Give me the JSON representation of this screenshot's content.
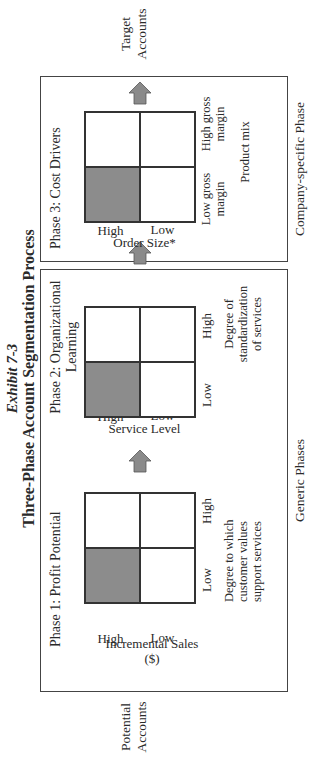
{
  "exhibit": {
    "label": "Exhibit 7-3",
    "title": "Three-Phase Account Segmentation Process"
  },
  "flow": {
    "start": {
      "line1": "Potential",
      "line2": "Accounts"
    },
    "end": {
      "line1": "Target",
      "line2": "Accounts"
    }
  },
  "sections": {
    "generic": {
      "label": "Generic Phases"
    },
    "company_specific": {
      "label": "Company-specific Phase"
    }
  },
  "phases": [
    {
      "title_line1": "Phase 1: Profit Potential",
      "title_line2": "",
      "y_axis_label": "Incremental Sales ($)",
      "y_high": "High",
      "y_low": "Low",
      "x_low": "Low",
      "x_high": "High",
      "x_axis_label_line1": "Degree to which",
      "x_axis_label_line2": "customer values",
      "x_axis_label_line3": "support services",
      "shaded_quadrant": "high-y / low-x"
    },
    {
      "title_line1": "Phase 2: Organizational",
      "title_line2": "Learning",
      "y_axis_label": "Service Level",
      "y_high": "High",
      "y_low": "Low",
      "x_low": "Low",
      "x_high": "High",
      "x_axis_label_line1": "Degree of",
      "x_axis_label_line2": "standardization",
      "x_axis_label_line3": "of services",
      "shaded_quadrant": "high-y / low-x"
    },
    {
      "title_line1": "Phase 3: Cost Drivers",
      "title_line2": "",
      "y_axis_label": "Order Size*",
      "y_high": "High",
      "y_low": "Low",
      "x_low_line1": "Low gross",
      "x_low_line2": "margin",
      "x_high_line1": "High gross",
      "x_high_line2": "margin",
      "x_axis_label_line1": "Product mix",
      "shaded_quadrant": "high-y / low-x"
    }
  ],
  "colors": {
    "shaded": "#8c8c8c",
    "arrow": "#8a8a8a",
    "border": "#333333"
  }
}
